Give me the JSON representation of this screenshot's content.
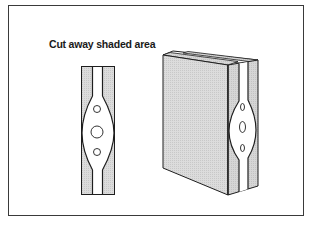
{
  "figure": {
    "title": "Cut away shaded area",
    "panels": [
      {
        "name": "cutaway-side-view",
        "description": "Flat cut-away section showing shaded outer layers and central channel with oval gasket containing three holes"
      },
      {
        "name": "assembled-3d-block",
        "description": "3D view of assembled block with shaded faces and exposed cut-away side showing oval gasket with three holes"
      }
    ],
    "colors": {
      "line": "#1e1e1e",
      "shade": "#d9d9d9",
      "shade_dark": "#cfcfcf",
      "background": "#ffffff",
      "frame": "#3a3a3a"
    }
  }
}
